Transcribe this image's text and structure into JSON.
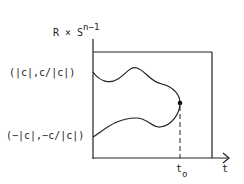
{
  "diagram": {
    "y_axis_label": {
      "base": "R × S",
      "superscript": "n−1"
    },
    "x_axis_label": "t",
    "upper_point_label": "(|c|,c/|c|)",
    "lower_point_label": "(−|c|,−c/|c|)",
    "time_marker": {
      "base": "t",
      "subscript": "o"
    },
    "colors": {
      "stroke": "#222222",
      "background": "#ffffff"
    }
  }
}
